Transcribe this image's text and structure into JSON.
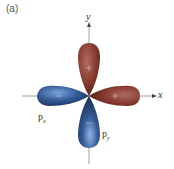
{
  "panel_label": "(a)",
  "axes": {
    "x_label": "x",
    "y_label": "y"
  },
  "orbitals": [
    {
      "name": "p",
      "subscript": "x",
      "lobes": [
        {
          "side": "left",
          "sign": "−",
          "color": "#3a5f9a"
        },
        {
          "side": "right",
          "sign": "+",
          "color": "#8a3f35"
        }
      ]
    },
    {
      "name": "p",
      "subscript": "y",
      "lobes": [
        {
          "side": "top",
          "sign": "+",
          "color": "#8a3f35"
        },
        {
          "side": "bottom",
          "sign": "−",
          "color": "#3a5f9a"
        }
      ]
    }
  ],
  "colors": {
    "positive": "#8a3f35",
    "negative": "#3a5f9a",
    "axis": "#888888"
  }
}
